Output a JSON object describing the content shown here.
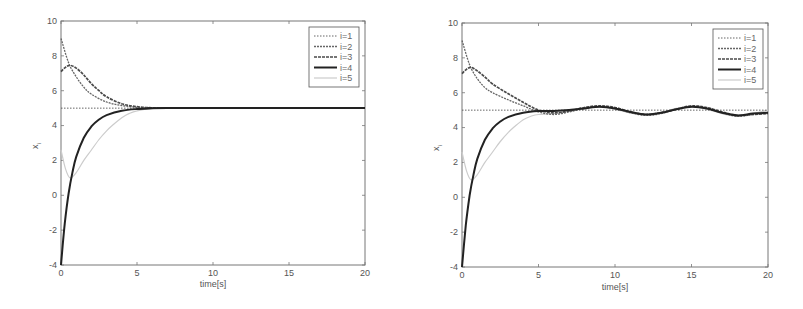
{
  "chart_data": [
    {
      "type": "line",
      "title": "",
      "xlabel": "time[s]",
      "ylabel": "x_i",
      "xlim": [
        0,
        20
      ],
      "ylim": [
        -4,
        10
      ],
      "xticks": [
        0,
        5,
        10,
        15,
        20
      ],
      "yticks": [
        -4,
        -2,
        0,
        2,
        4,
        6,
        8,
        10
      ],
      "grid": false,
      "legend_position": "upper right",
      "series": [
        {
          "name": "i=1",
          "style": "dotted",
          "color": "#555555",
          "x": [
            0,
            20
          ],
          "y": [
            5,
            5
          ]
        },
        {
          "name": "i=2",
          "style": "dashed-thin",
          "color": "#666666",
          "x": [
            0,
            0.5,
            1,
            1.5,
            2,
            3,
            4,
            5,
            6,
            7,
            8,
            20
          ],
          "y": [
            9.0,
            7.6,
            6.8,
            6.2,
            5.8,
            5.35,
            5.15,
            5.05,
            5.02,
            5.0,
            5.0,
            5.0
          ]
        },
        {
          "name": "i=3",
          "style": "dashed-thick",
          "color": "#4a4a4a",
          "x": [
            0,
            0.3,
            0.6,
            1,
            1.5,
            2,
            2.5,
            3,
            4,
            5,
            6,
            7,
            8,
            20
          ],
          "y": [
            7.1,
            7.35,
            7.45,
            7.3,
            6.9,
            6.4,
            6.0,
            5.65,
            5.25,
            5.08,
            5.02,
            5.0,
            5.0,
            5.0
          ]
        },
        {
          "name": "i=4",
          "style": "solid",
          "color": "#222222",
          "x": [
            0,
            0.25,
            0.5,
            0.75,
            1,
            1.5,
            2,
            2.5,
            3,
            4,
            5,
            6,
            7,
            20
          ],
          "y": [
            -4.0,
            -1.6,
            0.1,
            1.3,
            2.2,
            3.3,
            3.95,
            4.35,
            4.6,
            4.85,
            4.95,
            4.99,
            5.0,
            5.0
          ]
        },
        {
          "name": "i=5",
          "style": "solid-light",
          "color": "#cccccc",
          "x": [
            0,
            0.3,
            0.6,
            1,
            1.5,
            2,
            2.5,
            3,
            3.5,
            4,
            4.5,
            5,
            6,
            7,
            20
          ],
          "y": [
            2.6,
            1.5,
            1.0,
            1.3,
            2.0,
            2.6,
            3.2,
            3.7,
            4.1,
            4.45,
            4.7,
            4.85,
            4.97,
            5.0,
            5.0
          ]
        }
      ]
    },
    {
      "type": "line",
      "title": "",
      "xlabel": "time[s]",
      "ylabel": "x_i",
      "xlim": [
        0,
        20
      ],
      "ylim": [
        -4,
        10
      ],
      "xticks": [
        0,
        5,
        10,
        15,
        20
      ],
      "yticks": [
        -4,
        -2,
        0,
        2,
        4,
        6,
        8,
        10
      ],
      "grid": false,
      "legend_position": "upper right",
      "series": [
        {
          "name": "i=1",
          "style": "dotted",
          "color": "#555555",
          "x": [
            0,
            20
          ],
          "y": [
            5,
            5
          ]
        },
        {
          "name": "i=2",
          "style": "dashed-thin",
          "color": "#666666",
          "x": [
            0,
            0.5,
            1,
            1.5,
            2,
            3,
            4,
            5,
            6,
            7,
            8,
            9,
            10,
            11,
            12,
            13,
            14,
            15,
            16,
            17,
            18,
            19,
            20
          ],
          "y": [
            9.0,
            7.6,
            6.8,
            6.3,
            6.0,
            5.6,
            5.25,
            4.9,
            4.75,
            4.9,
            5.1,
            5.2,
            5.1,
            4.85,
            4.7,
            4.8,
            5.05,
            5.2,
            5.1,
            4.85,
            4.65,
            4.75,
            4.85
          ]
        },
        {
          "name": "i=3",
          "style": "dashed-thick",
          "color": "#4a4a4a",
          "x": [
            0,
            0.3,
            0.6,
            1,
            1.5,
            2,
            3,
            4,
            5,
            6,
            7,
            8,
            9,
            10,
            11,
            12,
            13,
            14,
            15,
            16,
            17,
            18,
            19,
            20
          ],
          "y": [
            7.1,
            7.35,
            7.45,
            7.25,
            6.9,
            6.5,
            5.95,
            5.45,
            5.0,
            4.85,
            4.95,
            5.15,
            5.25,
            5.15,
            4.9,
            4.75,
            4.85,
            5.05,
            5.25,
            5.15,
            4.9,
            4.7,
            4.75,
            4.8
          ]
        },
        {
          "name": "i=4",
          "style": "solid",
          "color": "#222222",
          "x": [
            0,
            0.25,
            0.5,
            0.75,
            1,
            1.5,
            2,
            2.5,
            3,
            4,
            5,
            6,
            7,
            8,
            9,
            10,
            11,
            12,
            13,
            14,
            15,
            16,
            17,
            18,
            19,
            20
          ],
          "y": [
            -4.0,
            -1.6,
            0.1,
            1.3,
            2.2,
            3.3,
            3.95,
            4.35,
            4.6,
            4.85,
            4.95,
            4.95,
            5.0,
            5.1,
            5.2,
            5.1,
            4.9,
            4.75,
            4.85,
            5.05,
            5.2,
            5.1,
            4.85,
            4.7,
            4.8,
            4.85
          ]
        },
        {
          "name": "i=5",
          "style": "solid-light",
          "color": "#cccccc",
          "x": [
            0,
            0.3,
            0.6,
            1,
            1.5,
            2,
            2.5,
            3,
            3.5,
            4,
            4.5,
            5,
            6,
            7,
            8,
            9,
            10,
            11,
            12,
            13,
            14,
            15,
            16,
            17,
            18,
            19,
            20
          ],
          "y": [
            2.6,
            1.5,
            1.0,
            1.3,
            2.0,
            2.6,
            3.2,
            3.7,
            4.1,
            4.45,
            4.65,
            4.75,
            4.8,
            4.95,
            5.15,
            5.2,
            5.05,
            4.85,
            4.75,
            4.85,
            5.1,
            5.2,
            5.05,
            4.8,
            4.65,
            4.8,
            5.0
          ]
        }
      ]
    }
  ],
  "plots": [
    {
      "xlabel": "time[s]",
      "ylabel_main": "x",
      "ylabel_sub": "i",
      "xtick_labels": [
        "0",
        "5",
        "10",
        "15",
        "20"
      ],
      "ytick_labels": [
        "-4",
        "-2",
        "0",
        "2",
        "4",
        "6",
        "8",
        "10"
      ],
      "legend": [
        "i=1",
        "i=2",
        "i=3",
        "i=4",
        "i=5"
      ]
    },
    {
      "xlabel": "time[s]",
      "ylabel_main": "x",
      "ylabel_sub": "i",
      "xtick_labels": [
        "0",
        "5",
        "10",
        "15",
        "20"
      ],
      "ytick_labels": [
        "-4",
        "-2",
        "0",
        "2",
        "4",
        "6",
        "8",
        "10"
      ],
      "legend": [
        "i=1",
        "i=2",
        "i=3",
        "i=4",
        "i=5"
      ]
    }
  ]
}
